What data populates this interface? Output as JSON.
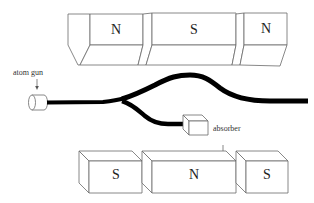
{
  "figure": {
    "top_magnets": [
      {
        "pole": "N"
      },
      {
        "pole": "S"
      },
      {
        "pole": "N"
      }
    ],
    "bottom_magnets": [
      {
        "pole": "S"
      },
      {
        "pole": "N"
      },
      {
        "pole": "S"
      }
    ],
    "labels": {
      "source": "atom gun",
      "absorber": "absorber"
    },
    "colors": {
      "beam": "#000000",
      "outline": "#6a6a6a",
      "background": "#ffffff"
    }
  }
}
